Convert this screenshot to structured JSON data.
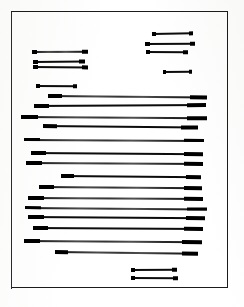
{
  "document": {
    "kind": "scanned-page",
    "description": "Photocopied document page with all text lines redacted as solid black bars",
    "page_background_color": "#ffffff",
    "ink_color": "#0c0c0c",
    "frame": {
      "border_color": "#1b1b1b",
      "x": 11,
      "y": 11,
      "width": 217,
      "height": 277
    },
    "canvas": {
      "width": 244,
      "height": 307
    }
  },
  "redacted_lines": [
    {
      "id": "line-r1",
      "group": "top-right-block",
      "x": 152,
      "y": 33,
      "width": 41,
      "height": 2.4,
      "skew": -0.9,
      "density": "solid"
    },
    {
      "id": "line-r2",
      "group": "top-right-block",
      "x": 145,
      "y": 43,
      "width": 50,
      "height": 2.0,
      "skew": -0.4,
      "density": "solid"
    },
    {
      "id": "line-r3",
      "group": "top-right-block",
      "x": 146,
      "y": 51,
      "width": 42,
      "height": 2.2,
      "skew": 0.3,
      "density": "solid"
    },
    {
      "id": "line-l1",
      "group": "top-left-block",
      "x": 32,
      "y": 51,
      "width": 56,
      "height": 2.0,
      "skew": -0.2,
      "density": "faded"
    },
    {
      "id": "line-l2",
      "group": "top-left-block",
      "x": 33,
      "y": 61,
      "width": 52,
      "height": 2.2,
      "skew": -0.5,
      "density": "solid"
    },
    {
      "id": "line-l3",
      "group": "top-left-block",
      "x": 33,
      "y": 66,
      "width": 55,
      "height": 2.2,
      "skew": 0.4,
      "density": "solid"
    },
    {
      "id": "line-r4",
      "group": "top-right-block",
      "x": 163,
      "y": 71,
      "width": 29,
      "height": 2.4,
      "skew": -0.4,
      "density": "solid"
    },
    {
      "id": "line-l4",
      "group": "mid-left-short",
      "x": 36,
      "y": 85,
      "width": 41,
      "height": 2.2,
      "skew": 0.3,
      "density": "solid"
    },
    {
      "id": "line-b1",
      "group": "body-block",
      "x": 48,
      "y": 95,
      "width": 159,
      "height": 2.0,
      "skew": 0.5,
      "density": "faded"
    },
    {
      "id": "line-b2",
      "group": "body-block",
      "x": 34,
      "y": 105,
      "width": 172,
      "height": 2.2,
      "skew": -0.3,
      "density": "solid"
    },
    {
      "id": "line-b3",
      "group": "body-block",
      "x": 21,
      "y": 116,
      "width": 186,
      "height": 2.0,
      "skew": 0.4,
      "density": "faded"
    },
    {
      "id": "line-b4",
      "group": "body-block",
      "x": 43,
      "y": 125,
      "width": 155,
      "height": 2.2,
      "skew": 0.6,
      "density": "solid"
    },
    {
      "id": "line-b5",
      "group": "body-block",
      "x": 24,
      "y": 139,
      "width": 180,
      "height": 1.9,
      "skew": 0.3,
      "density": "faded"
    },
    {
      "id": "line-b6",
      "group": "body-block",
      "x": 31,
      "y": 152,
      "width": 172,
      "height": 2.1,
      "skew": 0.4,
      "density": "solid"
    },
    {
      "id": "line-b7",
      "group": "body-block",
      "x": 26,
      "y": 162,
      "width": 177,
      "height": 2.0,
      "skew": 0.3,
      "density": "faded"
    },
    {
      "id": "line-b8",
      "group": "body-block",
      "x": 61,
      "y": 175,
      "width": 140,
      "height": 2.0,
      "skew": 0.5,
      "density": "solid"
    },
    {
      "id": "line-b9",
      "group": "body-block",
      "x": 39,
      "y": 186,
      "width": 163,
      "height": 2.0,
      "skew": 0.4,
      "density": "faded"
    },
    {
      "id": "line-b10",
      "group": "body-block",
      "x": 28,
      "y": 197,
      "width": 175,
      "height": 2.0,
      "skew": 0.3,
      "density": "faded"
    },
    {
      "id": "line-b11",
      "group": "body-block",
      "x": 25,
      "y": 207,
      "width": 182,
      "height": 1.9,
      "skew": 0.5,
      "density": "faded"
    },
    {
      "id": "line-b12",
      "group": "body-block",
      "x": 28,
      "y": 216,
      "width": 177,
      "height": 2.1,
      "skew": 0.4,
      "density": "solid"
    },
    {
      "id": "line-b13",
      "group": "body-block",
      "x": 33,
      "y": 227,
      "width": 170,
      "height": 2.1,
      "skew": 0.3,
      "density": "solid"
    },
    {
      "id": "line-b14",
      "group": "body-block",
      "x": 24,
      "y": 240,
      "width": 178,
      "height": 2.0,
      "skew": 0.4,
      "density": "faded"
    },
    {
      "id": "line-b15",
      "group": "body-block",
      "x": 55,
      "y": 251,
      "width": 143,
      "height": 2.0,
      "skew": 0.7,
      "density": "faded"
    },
    {
      "id": "line-f1",
      "group": "footer-block",
      "x": 131,
      "y": 269,
      "width": 46,
      "height": 2.2,
      "skew": -0.3,
      "density": "solid"
    },
    {
      "id": "line-f2",
      "group": "footer-block",
      "x": 131,
      "y": 277,
      "width": 47,
      "height": 2.4,
      "skew": 0.4,
      "density": "solid"
    }
  ]
}
